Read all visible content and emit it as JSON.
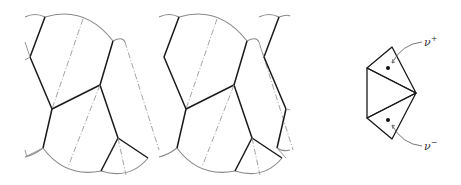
{
  "figure": {
    "period_px": 134,
    "tiles": 3,
    "inset": {
      "labels": {
        "nu_plus": "ν",
        "nu_plus_sup": "+",
        "nu_minus": "ν",
        "nu_minus_sup": "−"
      }
    }
  },
  "colors": {
    "edge": "#1a1a1a",
    "arc": "#8a8a8a",
    "dash": "#9a9a9a",
    "background": "#ffffff"
  }
}
